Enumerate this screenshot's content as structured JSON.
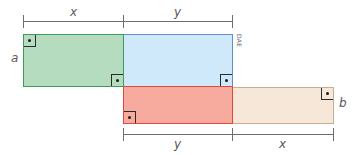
{
  "diagram": {
    "labels": {
      "top_x": "x",
      "top_y": "y",
      "left_a": "a",
      "right_b": "b",
      "bottom_y": "y",
      "bottom_x": "x"
    },
    "credit": "DAE",
    "colors": {
      "green_fill": "#b5dcbf",
      "green_stroke": "#3f9a55",
      "blue_fill": "#cfe8fa",
      "blue_stroke": "#5b8fd6",
      "red_fill": "#f6ab9e",
      "red_stroke": "#e0493a",
      "beige_fill": "#f7e7d8",
      "beige_stroke": "#c8ad96",
      "dimension_line": "#6d6d6d"
    },
    "rectangles": [
      {
        "name": "green",
        "dims": "x by a",
        "right_angle_marks": 2
      },
      {
        "name": "blue",
        "dims": "y by a",
        "right_angle_marks": 1
      },
      {
        "name": "red",
        "dims": "y by b",
        "right_angle_marks": 1
      },
      {
        "name": "beige",
        "dims": "x by b",
        "right_angle_marks": 1
      }
    ]
  }
}
